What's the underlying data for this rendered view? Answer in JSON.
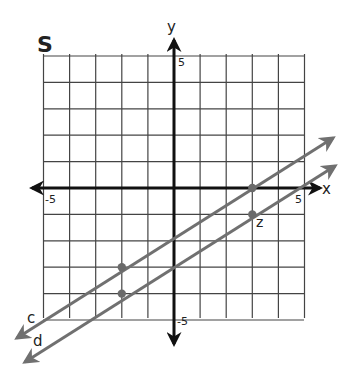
{
  "title": "S",
  "colors": {
    "grid": "#444444",
    "axis": "#111111",
    "line": "#707070",
    "point": "#6a6a6a",
    "text": "#222222"
  },
  "chart_data": {
    "type": "line",
    "title": "S",
    "xlabel": "x",
    "ylabel": "y",
    "xlim": [
      -5,
      5
    ],
    "ylim": [
      -5,
      5
    ],
    "grid": true,
    "tick_labels": {
      "x_min": "-5",
      "x_max": "5",
      "y_max": "5",
      "y_min": "-5"
    },
    "series": [
      {
        "name": "c",
        "slope": 0.6,
        "intercept": -1.8,
        "points": [
          [
            3,
            0
          ],
          [
            -2,
            -3
          ]
        ]
      },
      {
        "name": "d",
        "slope": 0.6,
        "intercept": -2.8,
        "points": [
          [
            3,
            -1
          ],
          [
            -2,
            -4
          ]
        ]
      }
    ],
    "annotations": [
      {
        "label": "z",
        "x": 3,
        "y": -1
      }
    ]
  }
}
